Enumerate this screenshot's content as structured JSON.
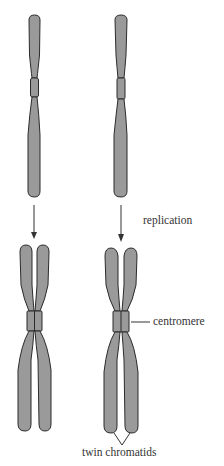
{
  "diagram": {
    "title": "",
    "labels": {
      "replication": "replication",
      "centromere": "centromere",
      "twin_chromatids": "twin chromatids"
    },
    "stages": [
      {
        "name": "before-replication",
        "chromosomes": 2,
        "description": "single-chromatid chromosomes"
      },
      {
        "name": "after-replication",
        "chromosomes": 2,
        "description": "duplicated chromosomes with twin chromatids joined at centromere"
      }
    ],
    "colors": {
      "chromosome_fill": "#9a9a9a",
      "outline": "#2b2b2b",
      "arrow": "#333333",
      "text": "#333333",
      "background": "#ffffff"
    }
  }
}
